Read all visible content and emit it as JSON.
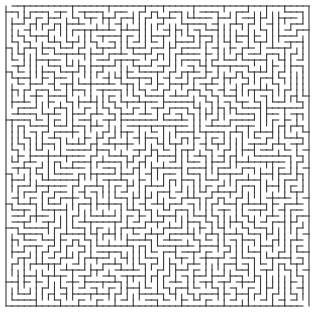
{
  "maze": {
    "cols": 50,
    "rows": 50,
    "origin_x": 6,
    "origin_y": 6,
    "cell_w": 6.06,
    "cell_h": 6.0,
    "wall_color": "#3a3a3a",
    "wall_width": 1.1,
    "background": "#ffffff",
    "seed": 1337,
    "entrance": {
      "side": "top",
      "col": 0
    },
    "exit": {
      "side": "bottom",
      "col": 49
    }
  }
}
